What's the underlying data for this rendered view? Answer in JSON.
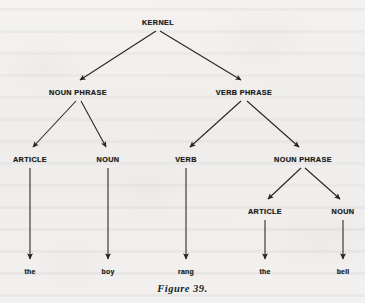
{
  "figure": {
    "caption": "Figure 39.",
    "sentence": "the boy rang the bell"
  },
  "colors": {
    "paper": "#f1f0ee",
    "ink": "#1d1c1b",
    "line": "#262423"
  },
  "tree": {
    "root": {
      "label": "KERNEL",
      "x": 158,
      "y": 22
    },
    "level2": [
      {
        "label": "NOUN PHRASE",
        "x": 78,
        "y": 92
      },
      {
        "label": "VERB PHRASE",
        "x": 244,
        "y": 92
      }
    ],
    "level3": [
      {
        "label": "ARTICLE",
        "x": 30,
        "y": 159
      },
      {
        "label": "NOUN",
        "x": 108,
        "y": 159
      },
      {
        "label": "VERB",
        "x": 186,
        "y": 159
      },
      {
        "label": "NOUN PHRASE",
        "x": 303,
        "y": 159
      }
    ],
    "level4": [
      {
        "label": "ARTICLE",
        "x": 265,
        "y": 211
      },
      {
        "label": "NOUN",
        "x": 343,
        "y": 211
      }
    ],
    "terminals": [
      {
        "label": "the",
        "x": 30,
        "y": 271
      },
      {
        "label": "boy",
        "x": 108,
        "y": 271
      },
      {
        "label": "rang",
        "x": 186,
        "y": 271
      },
      {
        "label": "the",
        "x": 265,
        "y": 271
      },
      {
        "label": "bell",
        "x": 343,
        "y": 271
      }
    ]
  }
}
